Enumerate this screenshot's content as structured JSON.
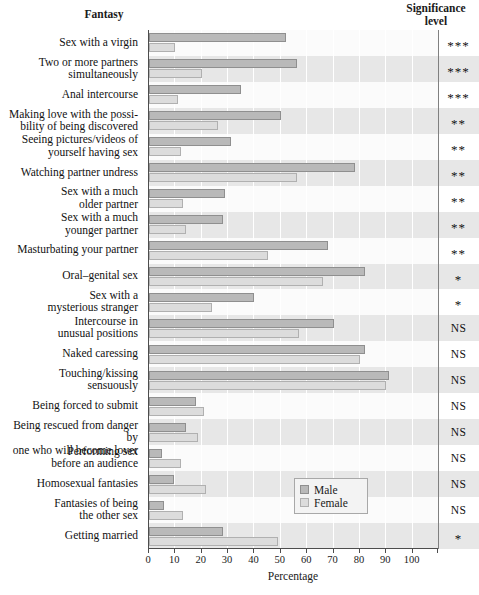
{
  "headers": {
    "fantasy": "Fantasy",
    "significance_line1": "Significance",
    "significance_line2": "level"
  },
  "legend": {
    "male_label": "Male",
    "female_label": "Female",
    "male_color": "#b9b9b9",
    "female_color": "#dcdcdc"
  },
  "chart_data": {
    "type": "bar",
    "orientation": "horizontal",
    "title": "",
    "xlabel": "Percentage",
    "ylabel": "Fantasy",
    "xlim": [
      0,
      110
    ],
    "xticks": [
      0,
      10,
      20,
      30,
      40,
      50,
      60,
      70,
      80,
      90,
      100
    ],
    "xticklabels": [
      "0",
      "10",
      "20",
      "30",
      "40",
      "50",
      "60",
      "70",
      "80",
      "90",
      "100"
    ],
    "grid": true,
    "legend_position": "inner-bottom-right",
    "categories": [
      "Sex with a virgin",
      "Two or more partners simultaneously",
      "Anal intercourse",
      "Making love with the possibility of being discovered",
      "Seeing pictures/videos of yourself having sex",
      "Watching partner undress",
      "Sex with a much older partner",
      "Sex with a much younger partner",
      "Masturbating your partner",
      "Oral–genital sex",
      "Sex with a mysterious stranger",
      "Intercourse in unusual positions",
      "Naked caressing",
      "Touching/kissing sensuously",
      "Being forced to submit",
      "Being rescued from danger by one who will become lover",
      "Performing sex before an audience",
      "Homosexual fantasies",
      "Fantasies of being the other sex",
      "Getting married"
    ],
    "category_lines": [
      [
        "Sex with a virgin"
      ],
      [
        "Two or more partners",
        "simultaneously"
      ],
      [
        "Anal intercourse"
      ],
      [
        "Making love with the possi-",
        "bility of being discovered"
      ],
      [
        "Seeing pictures/videos of",
        "yourself having sex"
      ],
      [
        "Watching partner undress"
      ],
      [
        "Sex with a much",
        "older partner"
      ],
      [
        "Sex with a much",
        "younger partner"
      ],
      [
        "Masturbating your partner"
      ],
      [
        "Oral–genital sex"
      ],
      [
        "Sex with a",
        "mysterious stranger"
      ],
      [
        "Intercourse in",
        "unusual positions"
      ],
      [
        "Naked caressing"
      ],
      [
        "Touching/kissing",
        "sensuously"
      ],
      [
        "Being forced to submit"
      ],
      [
        "Being rescued from danger by",
        "one who will become lover"
      ],
      [
        "Performing sex",
        "before an audience"
      ],
      [
        "Homosexual fantasies"
      ],
      [
        "Fantasies of being",
        "the other sex"
      ],
      [
        "Getting married"
      ]
    ],
    "series": [
      {
        "name": "Male",
        "color": "#b9b9b9",
        "values": [
          52,
          56,
          35,
          50,
          31,
          78,
          29,
          28,
          68,
          82,
          40,
          70,
          82,
          91,
          18,
          14,
          5,
          9.5,
          5.5,
          28
        ]
      },
      {
        "name": "Female",
        "color": "#dcdcdc",
        "values": [
          10,
          20,
          11,
          26,
          12,
          56,
          13,
          14,
          45,
          66,
          24,
          57,
          80,
          90,
          21,
          18.5,
          12,
          21.5,
          13,
          49
        ]
      }
    ],
    "significance": [
      "***",
      "***",
      "***",
      "**",
      "**",
      "**",
      "**",
      "**",
      "**",
      "*",
      "*",
      "NS",
      "NS",
      "NS",
      "NS",
      "NS",
      "NS",
      "NS",
      "NS",
      "*"
    ]
  }
}
